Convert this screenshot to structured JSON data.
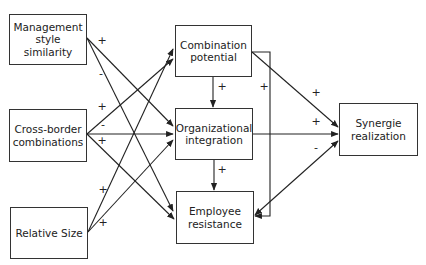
{
  "diagram": {
    "nodes": {
      "management": {
        "label": "Management style similarity",
        "x": 9,
        "y": 14,
        "w": 78,
        "h": 51
      },
      "crossborder": {
        "label": "Cross-border combinations",
        "x": 9,
        "y": 109,
        "w": 78,
        "h": 53
      },
      "relsize": {
        "label": "Relative Size",
        "x": 10,
        "y": 207,
        "w": 78,
        "h": 52
      },
      "combination": {
        "label": "Combination potential",
        "x": 175,
        "y": 25,
        "w": 77,
        "h": 52
      },
      "orgint": {
        "label": "Organizational integration",
        "x": 175,
        "y": 108,
        "w": 78,
        "h": 52
      },
      "resistance": {
        "label": "Employee resistance",
        "x": 176,
        "y": 191,
        "w": 78,
        "h": 53
      },
      "synergie": {
        "label": "Synergie realization",
        "x": 339,
        "y": 103,
        "w": 79,
        "h": 53
      }
    },
    "signs": [
      {
        "text": "+",
        "x": 102,
        "y": 40
      },
      {
        "text": "-",
        "x": 101,
        "y": 73
      },
      {
        "text": "+",
        "x": 102,
        "y": 106
      },
      {
        "text": "-",
        "x": 103,
        "y": 124
      },
      {
        "text": "+",
        "x": 102,
        "y": 140
      },
      {
        "text": "+",
        "x": 103,
        "y": 189
      },
      {
        "text": "+",
        "x": 103,
        "y": 222
      },
      {
        "text": "+",
        "x": 222,
        "y": 86
      },
      {
        "text": "+",
        "x": 264,
        "y": 86
      },
      {
        "text": "+",
        "x": 222,
        "y": 169
      },
      {
        "text": "+",
        "x": 316,
        "y": 92
      },
      {
        "text": "+",
        "x": 316,
        "y": 121
      },
      {
        "text": "-",
        "x": 316,
        "y": 147
      }
    ],
    "edges": [
      {
        "from": "management",
        "to": "orgint",
        "sign": "+",
        "points": [
          [
            87,
            38
          ],
          [
            173,
            126
          ]
        ]
      },
      {
        "from": "management",
        "to": "resistance",
        "sign": "-",
        "points": [
          [
            87,
            38
          ],
          [
            173,
            211
          ]
        ]
      },
      {
        "from": "crossborder",
        "to": "combination",
        "sign": "+",
        "points": [
          [
            87,
            134
          ],
          [
            173,
            59
          ]
        ]
      },
      {
        "from": "crossborder",
        "to": "orgint",
        "sign": "-",
        "points": [
          [
            87,
            134
          ],
          [
            173,
            134
          ]
        ]
      },
      {
        "from": "crossborder",
        "to": "resistance",
        "sign": "+",
        "points": [
          [
            87,
            134
          ],
          [
            174,
            219
          ]
        ]
      },
      {
        "from": "relsize",
        "to": "combination",
        "sign": "+",
        "points": [
          [
            88,
            232
          ],
          [
            173,
            49
          ]
        ]
      },
      {
        "from": "relsize",
        "to": "orgint",
        "sign": "+",
        "points": [
          [
            88,
            232
          ],
          [
            173,
            140
          ]
        ]
      },
      {
        "from": "combination",
        "to": "orgint",
        "sign": "+",
        "points": [
          [
            213,
            77
          ],
          [
            213,
            107
          ]
        ]
      },
      {
        "from": "orgint",
        "to": "resistance",
        "sign": "+",
        "points": [
          [
            214,
            160
          ],
          [
            214,
            190
          ]
        ]
      },
      {
        "from": "combination",
        "to": "resistance",
        "sign": "+",
        "points": [
          [
            252,
            52
          ],
          [
            270,
            52
          ],
          [
            270,
            216
          ],
          [
            255,
            216
          ]
        ]
      },
      {
        "from": "combination",
        "to": "synergie",
        "sign": "+",
        "points": [
          [
            252,
            52
          ],
          [
            338,
            127
          ]
        ]
      },
      {
        "from": "orgint",
        "to": "synergie",
        "sign": "+",
        "points": [
          [
            253,
            134
          ],
          [
            338,
            134
          ]
        ]
      },
      {
        "from": "resistance",
        "to": "synergie",
        "sign": "-",
        "points": [
          [
            255,
            215
          ],
          [
            338,
            141
          ]
        ],
        "bidirectional": true
      }
    ],
    "colors": {
      "line": "#222222",
      "border": "#333333",
      "background": "#ffffff"
    }
  }
}
